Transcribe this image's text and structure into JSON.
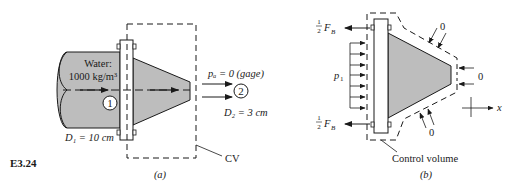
{
  "figure_id": "E3.24",
  "colors": {
    "fluid_fill": "#bdbdbd",
    "stroke": "#1a1a1a",
    "background": "#ffffff"
  },
  "panel_a": {
    "caption": "(a)",
    "fluid_label": "Water:",
    "density_label": "1000 kg/m³",
    "section1_marker": "1",
    "section2_marker": "2",
    "d1_label": "D₁ = 10 cm",
    "d2_label": "D₂ = 3 cm",
    "pa_label": "pₐ = 0 (gage)",
    "cv_label": "CV"
  },
  "panel_b": {
    "caption": "(b)",
    "control_volume_label": "Control volume",
    "bolt_force_top": "½ Fᴮ",
    "bolt_force_bottom": "½ Fᴮ",
    "half": "1",
    "two": "2",
    "force_symbol": "F",
    "force_sub": "B",
    "pressure_label": "p",
    "pressure_sub": "1",
    "zero_top": "0",
    "zero_right": "0",
    "zero_bottom": "0",
    "axis_label": "x"
  }
}
